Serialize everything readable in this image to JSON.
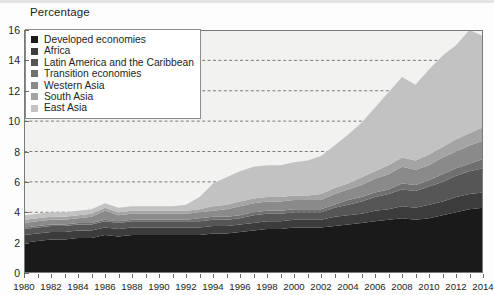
{
  "axis_title": "Percentage",
  "legend": {
    "items": [
      {
        "label": "Developed economies",
        "color": "#1a1a1a"
      },
      {
        "label": "Africa",
        "color": "#3c3c3c"
      },
      {
        "label": "Latin America and the Caribbean",
        "color": "#565656"
      },
      {
        "label": "Transition economies",
        "color": "#707070"
      },
      {
        "label": "Western Asia",
        "color": "#8a8a8a"
      },
      {
        "label": "South Asia",
        "color": "#a4a4a4"
      },
      {
        "label": "East Asia",
        "color": "#c2c2c2"
      }
    ]
  },
  "chart_data": {
    "type": "area",
    "stacked": true,
    "title": "",
    "subtitle": "",
    "xlabel": "",
    "ylabel": "Percentage",
    "xlim": [
      1980,
      2014
    ],
    "ylim": [
      0,
      16
    ],
    "ytick_step": 2,
    "xtick_step": 2,
    "grid": "horizontal-dashed",
    "legend_position": "top-left-inside",
    "yticks": [
      0,
      2,
      4,
      6,
      8,
      10,
      12,
      14,
      16
    ],
    "xticks": [
      1980,
      1982,
      1984,
      1986,
      1988,
      1990,
      1992,
      1994,
      1996,
      1998,
      2000,
      2002,
      2004,
      2006,
      2008,
      2010,
      2012,
      2014
    ],
    "x": [
      1980,
      1981,
      1982,
      1983,
      1984,
      1985,
      1986,
      1987,
      1988,
      1989,
      1990,
      1991,
      1992,
      1993,
      1994,
      1995,
      1996,
      1997,
      1998,
      1999,
      2000,
      2001,
      2002,
      2003,
      2004,
      2005,
      2006,
      2007,
      2008,
      2009,
      2010,
      2011,
      2012,
      2013,
      2014
    ],
    "series": [
      {
        "name": "Developed economies",
        "color": "#1a1a1a",
        "values": [
          2.0,
          2.1,
          2.2,
          2.2,
          2.3,
          2.3,
          2.5,
          2.4,
          2.5,
          2.5,
          2.5,
          2.5,
          2.5,
          2.5,
          2.6,
          2.6,
          2.7,
          2.8,
          2.9,
          2.9,
          3.0,
          3.0,
          3.0,
          3.1,
          3.2,
          3.3,
          3.4,
          3.5,
          3.6,
          3.5,
          3.6,
          3.8,
          4.0,
          4.2,
          4.3
        ]
      },
      {
        "name": "Africa",
        "color": "#3c3c3c",
        "values": [
          0.5,
          0.5,
          0.5,
          0.5,
          0.5,
          0.5,
          0.5,
          0.5,
          0.5,
          0.5,
          0.5,
          0.5,
          0.5,
          0.5,
          0.5,
          0.5,
          0.5,
          0.5,
          0.5,
          0.5,
          0.5,
          0.5,
          0.5,
          0.6,
          0.6,
          0.6,
          0.7,
          0.7,
          0.8,
          0.8,
          0.9,
          0.9,
          1.0,
          1.0,
          1.0
        ]
      },
      {
        "name": "Latin America and the Caribbean",
        "color": "#565656",
        "values": [
          0.4,
          0.4,
          0.4,
          0.4,
          0.4,
          0.4,
          0.4,
          0.4,
          0.4,
          0.4,
          0.4,
          0.4,
          0.4,
          0.4,
          0.4,
          0.4,
          0.4,
          0.5,
          0.5,
          0.5,
          0.5,
          0.5,
          0.5,
          0.6,
          0.7,
          0.8,
          0.9,
          1.0,
          1.1,
          1.1,
          1.2,
          1.3,
          1.4,
          1.5,
          1.6
        ]
      },
      {
        "name": "Transition economies",
        "color": "#707070",
        "values": [
          0.1,
          0.1,
          0.1,
          0.1,
          0.1,
          0.1,
          0.1,
          0.1,
          0.1,
          0.1,
          0.1,
          0.1,
          0.1,
          0.2,
          0.2,
          0.2,
          0.2,
          0.2,
          0.2,
          0.2,
          0.2,
          0.2,
          0.2,
          0.2,
          0.3,
          0.3,
          0.3,
          0.3,
          0.4,
          0.4,
          0.4,
          0.5,
          0.5,
          0.5,
          0.6
        ]
      },
      {
        "name": "Western Asia",
        "color": "#8a8a8a",
        "values": [
          0.3,
          0.3,
          0.3,
          0.3,
          0.3,
          0.4,
          0.6,
          0.4,
          0.4,
          0.4,
          0.4,
          0.4,
          0.4,
          0.4,
          0.4,
          0.5,
          0.6,
          0.6,
          0.6,
          0.6,
          0.6,
          0.6,
          0.6,
          0.7,
          0.7,
          0.8,
          0.9,
          1.0,
          1.1,
          1.0,
          1.0,
          1.1,
          1.1,
          1.2,
          1.2
        ]
      },
      {
        "name": "South Asia",
        "color": "#a4a4a4",
        "values": [
          0.2,
          0.2,
          0.2,
          0.2,
          0.2,
          0.2,
          0.2,
          0.2,
          0.2,
          0.2,
          0.2,
          0.2,
          0.2,
          0.2,
          0.3,
          0.3,
          0.3,
          0.3,
          0.3,
          0.3,
          0.3,
          0.3,
          0.4,
          0.4,
          0.4,
          0.5,
          0.5,
          0.6,
          0.6,
          0.6,
          0.7,
          0.7,
          0.8,
          0.8,
          0.9
        ]
      },
      {
        "name": "East Asia",
        "color": "#c2c2c2",
        "values": [
          0.3,
          0.3,
          0.3,
          0.3,
          0.3,
          0.3,
          0.3,
          0.3,
          0.3,
          0.3,
          0.3,
          0.3,
          0.4,
          0.8,
          1.5,
          1.8,
          2.0,
          2.1,
          2.1,
          2.1,
          2.2,
          2.3,
          2.5,
          2.8,
          3.2,
          3.6,
          4.2,
          4.8,
          5.3,
          5.0,
          5.6,
          6.0,
          6.2,
          6.8,
          6.0
        ]
      }
    ]
  }
}
